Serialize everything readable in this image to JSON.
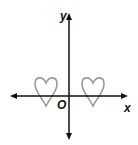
{
  "axes": {
    "x_label": "x",
    "y_label": "y",
    "origin_label": "O"
  },
  "colors": {
    "axis": "#111111",
    "shape": "#9a9a9a"
  },
  "shapes": [
    {
      "name": "left-heart",
      "center_x": 46,
      "top": 78
    },
    {
      "name": "right-heart",
      "center_x": 93,
      "top": 78
    }
  ]
}
